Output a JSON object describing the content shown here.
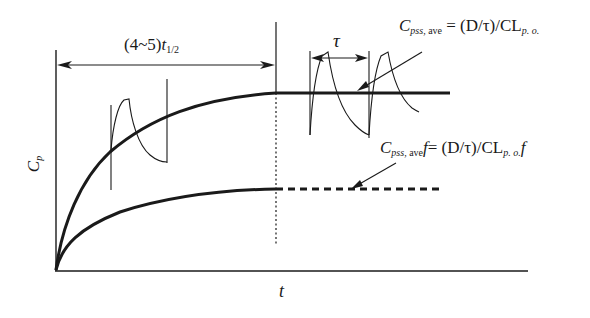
{
  "diagram": {
    "title": "",
    "axes": {
      "x_label": "t",
      "y_label_main": "C",
      "y_label_sub": "p"
    },
    "interval_label": {
      "prefix": "(4~5)",
      "var": "t",
      "sub": "1/2"
    },
    "tau_label": "τ",
    "formula_top": {
      "lhs_main": "C",
      "lhs_sub_it": "pss,",
      "lhs_sub_rm": " ave",
      "eq": " = (D/τ)/CL",
      "rhs_sub": "p. o."
    },
    "formula_bottom": {
      "lhs_main": "C",
      "lhs_sub_it": "pss,",
      "lhs_sub_rm": " ave",
      "lhs_f": "f",
      "eq": "= (D/τ)/CL",
      "rhs_sub": "p. o.",
      "rhs_f": "f"
    },
    "curves": [
      {
        "name": "oral-dosing-accumulation",
        "plateau_y": 93,
        "style": "solid"
      },
      {
        "name": "bioavailability-adjusted-accumulation",
        "plateau_y": 189,
        "style": "solid-then-dashed"
      }
    ],
    "colors": {
      "ink": "#1a1a1a",
      "background": "#ffffff"
    }
  }
}
